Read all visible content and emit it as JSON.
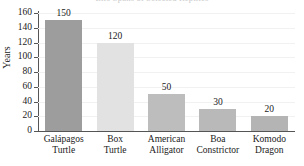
{
  "chart_data": {
    "type": "bar",
    "title": "",
    "cropped_title_fragment": "Life Spans of Selected Reptiles",
    "xlabel": "",
    "ylabel": "Years",
    "ylim": [
      0,
      160
    ],
    "ytick_step": 20,
    "yticks": [
      0,
      20,
      40,
      60,
      80,
      100,
      120,
      140,
      160
    ],
    "grid": true,
    "legend": "none",
    "categories": [
      "Galápagos Turtle",
      "Box Turtle",
      "American Alligator",
      "Boa Constrictor",
      "Komodo Dragon"
    ],
    "category_lines": [
      [
        "Galápagos",
        "Turtle"
      ],
      [
        "Box",
        "Turtle"
      ],
      [
        "American",
        "Alligator"
      ],
      [
        "Boa",
        "Constrictor"
      ],
      [
        "Komodo",
        "Dragon"
      ]
    ],
    "values": [
      150,
      120,
      50,
      30,
      20
    ],
    "value_labels": [
      "150",
      "120",
      "50",
      "30",
      "20"
    ],
    "bar_colors": [
      "#9d9d9d",
      "#e2e2e2",
      "#bdbdbd",
      "#b9b9b9",
      "#b4b4b4"
    ]
  },
  "colors": {
    "axis": "#555555",
    "grid": "#f1f1f1",
    "text": "#1a1a1a",
    "background": "#ffffff"
  }
}
